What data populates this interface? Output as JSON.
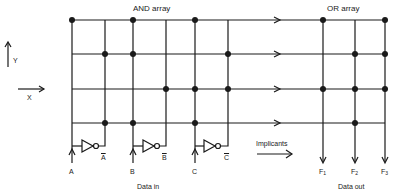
{
  "title_and": "AND array",
  "title_or": "OR array",
  "axes": {
    "y_label": "Y",
    "x_label": "X"
  },
  "inputs": [
    {
      "name": "A",
      "inverted": "A"
    },
    {
      "name": "B",
      "inverted": "B"
    },
    {
      "name": "C",
      "inverted": "C"
    }
  ],
  "data_in_label": "Data in",
  "implicants_label": "Implicants",
  "outputs": [
    {
      "name": "F",
      "sub": "1"
    },
    {
      "name": "F",
      "sub": "2"
    },
    {
      "name": "F",
      "sub": "3"
    }
  ],
  "data_out_label": "Data out",
  "colors": {
    "line": "#1a1a1a",
    "background": "#ffffff"
  },
  "diagram_data": {
    "type": "PLA",
    "and_columns": [
      "A",
      "A-bar",
      "B",
      "B-bar",
      "C",
      "C-bar"
    ],
    "or_columns": [
      "F1",
      "F2",
      "F3"
    ],
    "rows": 4,
    "and_connections": [
      [
        "A",
        "B",
        "C"
      ],
      [
        "A-bar",
        "B",
        "C-bar"
      ],
      [
        "B-bar",
        "C",
        "C-bar"
      ],
      [
        "A-bar",
        "B",
        "C"
      ]
    ],
    "or_connections": [
      [
        "F1",
        "F3"
      ],
      [
        "F2",
        "F3"
      ],
      [
        "F1",
        "F2",
        "F3"
      ],
      [
        "F2"
      ]
    ]
  }
}
